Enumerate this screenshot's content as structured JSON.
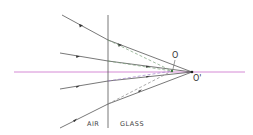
{
  "diagram": {
    "title": "",
    "type": "refraction-ray-diagram",
    "colors": {
      "axis": "#d07ad0",
      "ray": "#555555",
      "interface": "#555555",
      "dashed": "#7aa07a",
      "dashed_alt": "#a080c8"
    },
    "labels": {
      "left_medium": "AIR",
      "right_medium": "GLASS",
      "object_point": "O",
      "image_point": "O'"
    },
    "interface": {
      "x": 108,
      "y1": 15,
      "y2": 128
    },
    "axis": {
      "y": 72,
      "x1": 14,
      "x2": 245
    },
    "points": {
      "O": {
        "x": 172,
        "y": 71
      },
      "O_prime": {
        "x": 192,
        "y": 72
      }
    },
    "rays": [
      {
        "start": [
          62,
          15
        ],
        "hit": [
          108,
          40
        ]
      },
      {
        "start": [
          60,
          53
        ],
        "hit": [
          108,
          61
        ]
      },
      {
        "start": [
          60,
          89
        ],
        "hit": [
          108,
          81
        ]
      },
      {
        "start": [
          60,
          128
        ],
        "hit": [
          108,
          104
        ]
      }
    ]
  }
}
